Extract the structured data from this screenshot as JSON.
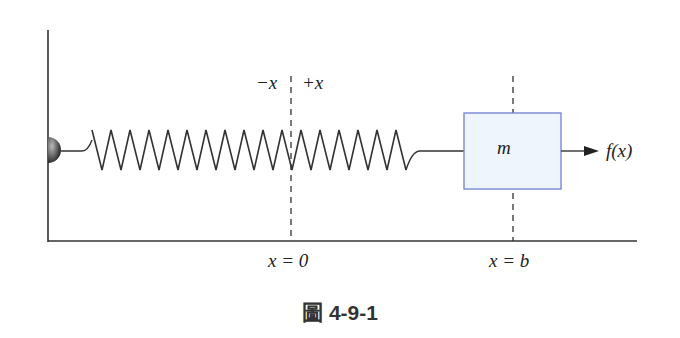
{
  "figure": {
    "caption": "圖 4-9-1",
    "labels": {
      "neg_x": "−x",
      "pos_x": "+x",
      "origin": "x = 0",
      "mass_position": "x = b",
      "mass": "m",
      "force": "f(x)"
    },
    "colors": {
      "line": "#333333",
      "box_fill": "#eef5fc",
      "box_stroke": "#7b86d6"
    }
  }
}
